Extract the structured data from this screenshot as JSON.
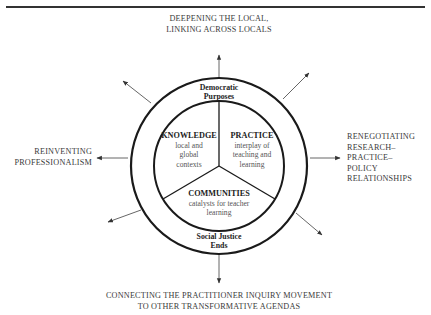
{
  "figure": {
    "caption_fragment": "",
    "outcomes": {
      "top": [
        "DEEPENING THE LOCAL,",
        "LINKING ACROSS LOCALS"
      ],
      "left": [
        "REINVENTING",
        "PROFESSIONALISM"
      ],
      "right": [
        "RENEGOTIATING",
        "RESEARCH–",
        "PRACTICE–",
        "POLICY",
        "RELATIONSHIPS"
      ],
      "bottom": [
        "CONNECTING THE PRACTITIONER INQUIRY MOVEMENT",
        "TO OTHER TRANSFORMATIVE AGENDAS"
      ]
    },
    "outer_ring": {
      "top": [
        "Democratic",
        "Purposes"
      ],
      "bottom": [
        "Social Justice",
        "Ends"
      ]
    },
    "segments": [
      {
        "title": "KNOWLEDGE",
        "desc": [
          "local and",
          "global",
          "contexts"
        ]
      },
      {
        "title": "PRACTICE",
        "desc": [
          "interplay of",
          "teaching and",
          "learning"
        ]
      },
      {
        "title": "COMMUNITIES",
        "desc": [
          "catalysts for teacher",
          "learning"
        ]
      }
    ],
    "colors": {
      "stroke": "#1a1a1a",
      "arrow": "#444444",
      "text": "#3a3a3a"
    }
  }
}
